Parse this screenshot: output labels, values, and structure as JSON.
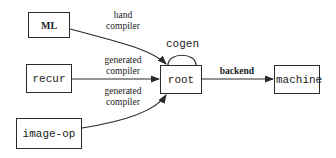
{
  "diagram": {
    "nodes": {
      "ml": "ML",
      "recur": "recur",
      "image_op": "image-op",
      "root": "root",
      "machine": "machine"
    },
    "edges": {
      "ml_root": [
        "hand",
        "compiler"
      ],
      "recur_root": [
        "generated",
        "compiler"
      ],
      "imageop_root": [
        "generated",
        "compiler"
      ],
      "root_self": "cogen",
      "root_machine": "backend"
    },
    "colors": {
      "line": "#2a2a2a",
      "background": "#ffffff"
    }
  }
}
